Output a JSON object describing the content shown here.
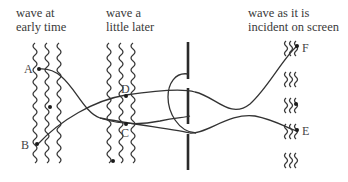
{
  "labels": {
    "early": [
      "wave at",
      "early time"
    ],
    "later": [
      "wave a",
      "little later"
    ],
    "screen": [
      "wave as it is",
      "incident on screen"
    ]
  },
  "points": {
    "A": "A",
    "B": "B",
    "C": "C",
    "D": "D",
    "E": "E",
    "F": "F"
  },
  "colors": {
    "ink": "#333333",
    "background": "#ffffff"
  }
}
